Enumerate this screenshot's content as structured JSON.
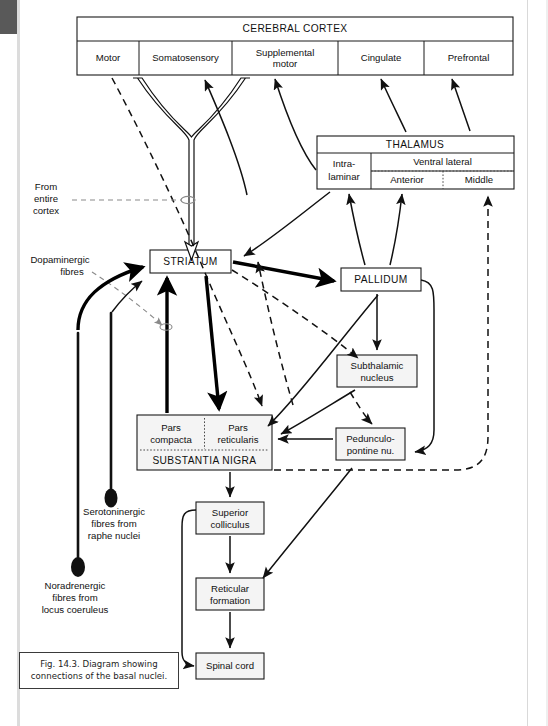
{
  "figure": {
    "caption_line1": "Fig. 14.3. Diagram showing",
    "caption_line2": "connections of the basal nuclei."
  },
  "cortex": {
    "title": "CEREBRAL CORTEX",
    "regions": [
      {
        "label": "Motor"
      },
      {
        "label": "Somatosensory"
      },
      {
        "label_line1": "Supplemental",
        "label_line2": "motor"
      },
      {
        "label": "Cingulate"
      },
      {
        "label": "Prefrontal"
      }
    ]
  },
  "thalamus": {
    "title": "THALAMUS",
    "intralaminar_line1": "Intra-",
    "intralaminar_line2": "laminar",
    "ventral_lateral": "Ventral lateral",
    "anterior": "Anterior",
    "middle": "Middle"
  },
  "nuclei": {
    "striatum": "STRIATUM",
    "pallidum": "PALLIDUM",
    "subthalamic_line1": "Subthalamic",
    "subthalamic_line2": "nucleus",
    "peduncular_line1": "Pedunculo-",
    "peduncular_line2": "pontine nu.",
    "pars_compacta_line1": "Pars",
    "pars_compacta_line2": "compacta",
    "pars_reticularis_line1": "Pars",
    "pars_reticularis_line2": "reticularis",
    "substantia_nigra": "SUBSTANTIA NIGRA",
    "superior_colliculus_line1": "Superior",
    "superior_colliculus_line2": "colliculus",
    "reticular_formation_line1": "Reticular",
    "reticular_formation_line2": "formation",
    "spinal_cord": "Spinal cord"
  },
  "afferents": {
    "from_cortex_line1": "From",
    "from_cortex_line2": "entire",
    "from_cortex_line3": "cortex",
    "dopaminergic_line1": "Dopaminergic",
    "dopaminergic_line2": "fibres",
    "serotoninergic_line1": "Serotoninergic",
    "serotoninergic_line2": "fibres from",
    "serotoninergic_line3": "raphe nuclei",
    "noradrenergic_line1": "Noradrenergic",
    "noradrenergic_line2": "fibres from",
    "noradrenergic_line3": "locus coeruleus"
  },
  "colors": {
    "ink": "#111111",
    "box_fill": "#f4f4f4",
    "page": "#ffffff"
  }
}
